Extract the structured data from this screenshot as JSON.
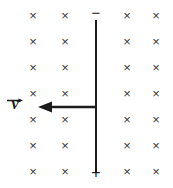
{
  "figure": {
    "width": 173,
    "height": 188,
    "background_color": "#ffffff",
    "ink_color": "#1b1b1b",
    "field_mark_color": "#3a3a3a"
  },
  "magnetic_field": {
    "symbol": "×",
    "meaning": "field-into-page",
    "columns_x": [
      33,
      65,
      127,
      156
    ],
    "rows_y": [
      15,
      41,
      67,
      93,
      119,
      145,
      171
    ],
    "count": 28,
    "marks": [
      {
        "x": 33,
        "y": 15
      },
      {
        "x": 65,
        "y": 15
      },
      {
        "x": 127,
        "y": 15
      },
      {
        "x": 156,
        "y": 15
      },
      {
        "x": 33,
        "y": 41
      },
      {
        "x": 65,
        "y": 41
      },
      {
        "x": 127,
        "y": 41
      },
      {
        "x": 156,
        "y": 41
      },
      {
        "x": 33,
        "y": 67
      },
      {
        "x": 65,
        "y": 67
      },
      {
        "x": 127,
        "y": 67
      },
      {
        "x": 156,
        "y": 67
      },
      {
        "x": 33,
        "y": 93
      },
      {
        "x": 65,
        "y": 93
      },
      {
        "x": 127,
        "y": 93
      },
      {
        "x": 156,
        "y": 93
      },
      {
        "x": 33,
        "y": 119
      },
      {
        "x": 65,
        "y": 119
      },
      {
        "x": 127,
        "y": 119
      },
      {
        "x": 156,
        "y": 119
      },
      {
        "x": 33,
        "y": 145
      },
      {
        "x": 65,
        "y": 145
      },
      {
        "x": 127,
        "y": 145
      },
      {
        "x": 156,
        "y": 145
      },
      {
        "x": 33,
        "y": 171
      },
      {
        "x": 65,
        "y": 171
      },
      {
        "x": 127,
        "y": 171
      },
      {
        "x": 156,
        "y": 171
      }
    ]
  },
  "rod": {
    "x": 96,
    "top_y": 20,
    "bottom_y": 172,
    "thickness": 2,
    "color": "#1b1b1b"
  },
  "polarity": {
    "negative": {
      "label": "−",
      "x": 96,
      "y": 12
    },
    "positive": {
      "label": "+",
      "x": 96,
      "y": 173
    }
  },
  "velocity": {
    "label_letter": "v",
    "vector_notation": "arrow-over",
    "direction": "left",
    "label_x": 15,
    "label_y": 100,
    "arrow_tail_x": 96,
    "arrow_tip_x": 38,
    "arrow_y": 107,
    "arrow_color": "#1b1b1b"
  }
}
